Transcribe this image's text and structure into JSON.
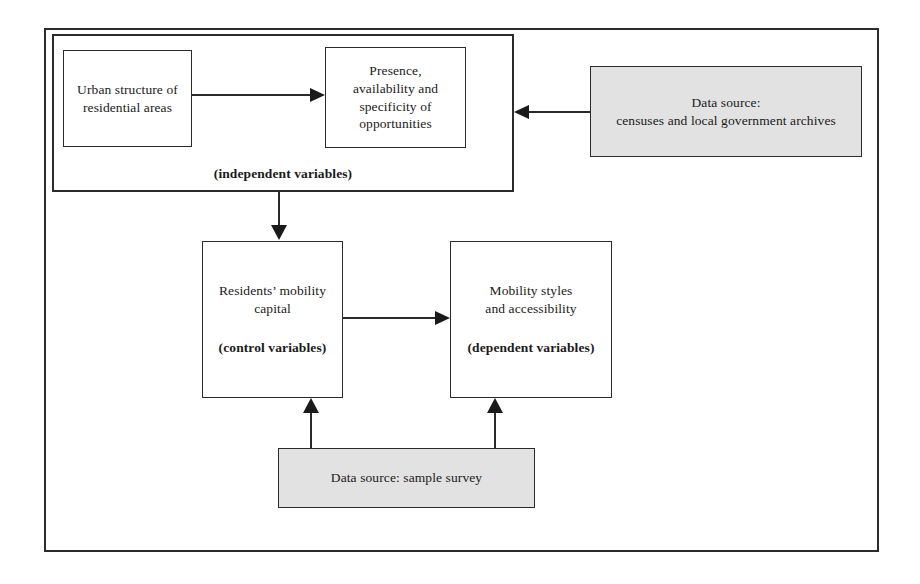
{
  "diagram": {
    "colors": {
      "stroke": "#2b2b2b",
      "text": "#1a1a1a",
      "data_source_fill": "#e2e2e2",
      "node_fill": "#ffffff",
      "background": "#ffffff"
    },
    "group": {
      "label": "(independent variables)"
    },
    "nodes": {
      "urban_structure": {
        "line1": "Urban structure of",
        "line2": "residential areas"
      },
      "opportunities": {
        "line1": "Presence,",
        "line2": "availability and",
        "line3": "specificity of",
        "line4": "opportunities"
      },
      "censuses": {
        "line1": "Data source:",
        "line2": "censuses and local government archives"
      },
      "residents_mobility": {
        "line1": "Residents’ mobility",
        "line2": "capital",
        "role": "(control variables)"
      },
      "mobility_styles": {
        "line1": "Mobility styles",
        "line2": "and accessibility",
        "role": "(dependent variables)"
      },
      "sample_survey": {
        "line1": "Data source: sample survey"
      }
    },
    "connectors": [
      {
        "name": "urban-to-opportunities",
        "from": "urban_structure",
        "to": "opportunities",
        "direction": "right"
      },
      {
        "name": "censuses-to-group",
        "from": "censuses",
        "to": "independent_variables_group",
        "direction": "left"
      },
      {
        "name": "group-to-residents",
        "from": "independent_variables_group",
        "to": "residents_mobility",
        "direction": "down"
      },
      {
        "name": "residents-to-mobility-styles",
        "from": "residents_mobility",
        "to": "mobility_styles",
        "direction": "right"
      },
      {
        "name": "survey-to-residents",
        "from": "sample_survey",
        "to": "residents_mobility",
        "direction": "up"
      },
      {
        "name": "survey-to-mobility-styles",
        "from": "sample_survey",
        "to": "mobility_styles",
        "direction": "up"
      }
    ]
  }
}
